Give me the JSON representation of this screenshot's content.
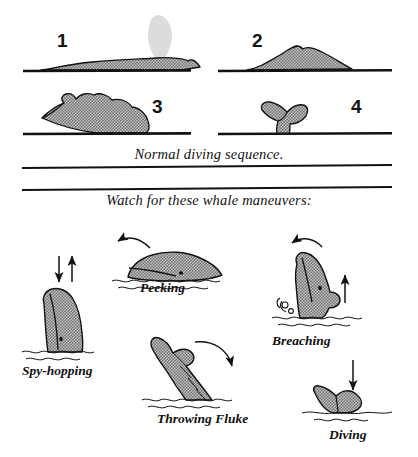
{
  "illustration": {
    "title_alt": "Whale diving sequence and maneuvers",
    "colors": {
      "ink": "#111111",
      "stipple_fill": "#b9b9b9",
      "stipple_dot": "#4a4a4a",
      "blow_spout": "#d8d8d8",
      "paper": "#ffffff"
    }
  },
  "sequence": {
    "caption": "Normal diving sequence.",
    "stages": [
      {
        "number": "1",
        "name": "blow-surfacing",
        "note": "back at surface with blow spout"
      },
      {
        "number": "2",
        "name": "arched-back",
        "note": "rounded back with dorsal hump"
      },
      {
        "number": "3",
        "name": "deep-arch",
        "note": "steep arch, tail stock rising"
      },
      {
        "number": "4",
        "name": "fluke-up",
        "note": "flukes raised above waterline"
      }
    ]
  },
  "maneuvers": {
    "caption": "Watch for these whale maneuvers:",
    "items": [
      {
        "label": "Spy-hopping",
        "arrows": "down-and-up vertical pair"
      },
      {
        "label": "Peeking",
        "arrows": "curved arrow sweeping left-down"
      },
      {
        "label": "Breaching",
        "arrows": "curved arrow left-down plus straight up arrow"
      },
      {
        "label": "Throwing Fluke",
        "arrows": "curved arrow sweeping right-down"
      },
      {
        "label": "Diving",
        "arrows": "straight down arrow"
      }
    ]
  },
  "dividers": [
    {
      "name": "divider-upper",
      "note": "rule below sequence caption"
    },
    {
      "name": "divider-lower",
      "note": "rule above maneuvers caption"
    }
  ]
}
